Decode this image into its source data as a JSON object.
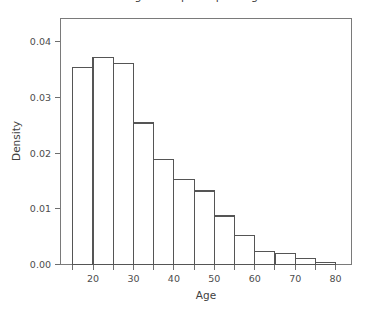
{
  "chart_data": {
    "type": "bar",
    "title": "Histogram of participant age",
    "xlabel": "Age",
    "ylabel": "Density",
    "xlim": [
      15,
      80
    ],
    "ylim": [
      0.0,
      0.042
    ],
    "grid": false,
    "legend": "none",
    "bin_width": 5,
    "x_ticks": [
      20,
      30,
      40,
      50,
      60,
      70,
      80
    ],
    "x_tick_labels": [
      "20",
      "30",
      "40",
      "50",
      "60",
      "70",
      "80"
    ],
    "x_minor_ticks": [
      15,
      25,
      35,
      45,
      55,
      65,
      75
    ],
    "y_ticks": [
      0.0,
      0.01,
      0.02,
      0.03,
      0.04
    ],
    "y_tick_labels": [
      "0.00",
      "0.01",
      "0.02",
      "0.03",
      "0.04"
    ],
    "categories": [
      "15-20",
      "20-25",
      "25-30",
      "30-35",
      "35-40",
      "40-45",
      "45-50",
      "50-55",
      "55-60",
      "60-65",
      "65-70",
      "70-75",
      "75-80"
    ],
    "bin_edges": [
      15,
      20,
      25,
      30,
      35,
      40,
      45,
      50,
      55,
      60,
      65,
      70,
      75,
      80
    ],
    "values": [
      0.0354,
      0.0372,
      0.0361,
      0.0254,
      0.0189,
      0.0153,
      0.0132,
      0.0087,
      0.0052,
      0.0024,
      0.0019,
      0.0011,
      0.0004
    ]
  },
  "style": {
    "bar_stroke": "#555555",
    "bar_fill": "none",
    "axis_color": "#6e6e6e",
    "text_color": "#4d4d4d",
    "background": "#ffffff"
  }
}
